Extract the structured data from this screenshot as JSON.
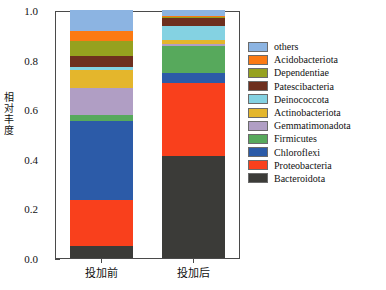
{
  "chart_data": {
    "type": "bar",
    "title": "",
    "subtitle": "",
    "xlabel": "",
    "ylabel": "相对丰度",
    "ylim": [
      0.0,
      1.0
    ],
    "grid": false,
    "stacked": true,
    "legend_position": "right",
    "categories": [
      "投加前",
      "投加后"
    ],
    "tick_labels_y": [
      "0.0",
      "0.2",
      "0.4",
      "0.6",
      "0.8",
      "1.0"
    ],
    "tick_values_y": [
      0.0,
      0.2,
      0.4,
      0.6,
      0.8,
      1.0
    ],
    "minor_tick_values_y": [
      0.1,
      0.3,
      0.5,
      0.7,
      0.9
    ],
    "series": [
      {
        "name": "Bacteroidota",
        "color": "#3b3b38",
        "values": [
          0.048,
          0.41
        ]
      },
      {
        "name": "Proteobacteria",
        "color": "#f9401c",
        "values": [
          0.187,
          0.295
        ]
      },
      {
        "name": "Chloroflexi",
        "color": "#2c5ba8",
        "values": [
          0.317,
          0.04
        ]
      },
      {
        "name": "Firmicutes",
        "color": "#57a95c",
        "values": [
          0.026,
          0.11
        ]
      },
      {
        "name": "Gemmatimonadota",
        "color": "#b09ec4",
        "values": [
          0.107,
          0.007
        ]
      },
      {
        "name": "Actinobacteriota",
        "color": "#e4b62c",
        "values": [
          0.073,
          0.018
        ]
      },
      {
        "name": "Deinococcota",
        "color": "#84d2e2",
        "values": [
          0.014,
          0.055
        ]
      },
      {
        "name": "Patescibacteria",
        "color": "#6e2f1e",
        "values": [
          0.043,
          0.033
        ]
      },
      {
        "name": "Dependentiae",
        "color": "#96a11f",
        "values": [
          0.06,
          0.004
        ]
      },
      {
        "name": "Acidobacteriota",
        "color": "#fb7a13",
        "values": [
          0.04,
          0.003
        ]
      },
      {
        "name": "others",
        "color": "#8cb4e2",
        "values": [
          0.085,
          0.025
        ]
      }
    ],
    "legend_order": [
      "others",
      "Acidobacteriota",
      "Dependentiae",
      "Patescibacteria",
      "Deinococcota",
      "Actinobacteriota",
      "Gemmatimonadota",
      "Firmicutes",
      "Chloroflexi",
      "Proteobacteria",
      "Bacteroidota"
    ]
  },
  "axis": {
    "y_title": "相对丰度",
    "y_title_chars": [
      "相",
      "对",
      "丰",
      "度"
    ]
  }
}
